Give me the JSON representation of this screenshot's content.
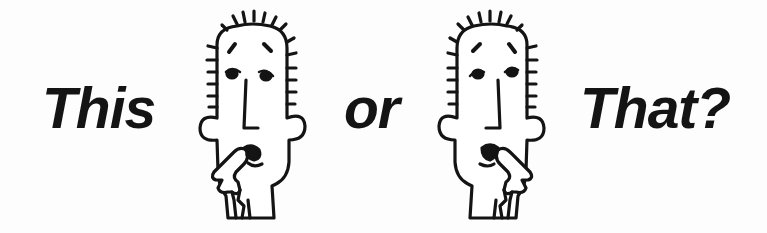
{
  "title": {
    "word_1": "This",
    "word_2": "or",
    "word_3": "That?"
  },
  "illustrations": [
    {
      "name": "thinking-face-left",
      "description": "spiky-haired cartoon face touching chin with finger (hand on left)"
    },
    {
      "name": "thinking-face-right",
      "description": "spiky-haired cartoon face touching chin with finger (hand on right)"
    }
  ],
  "colors": {
    "ink": "#141414",
    "background": "#fdfdfd"
  }
}
